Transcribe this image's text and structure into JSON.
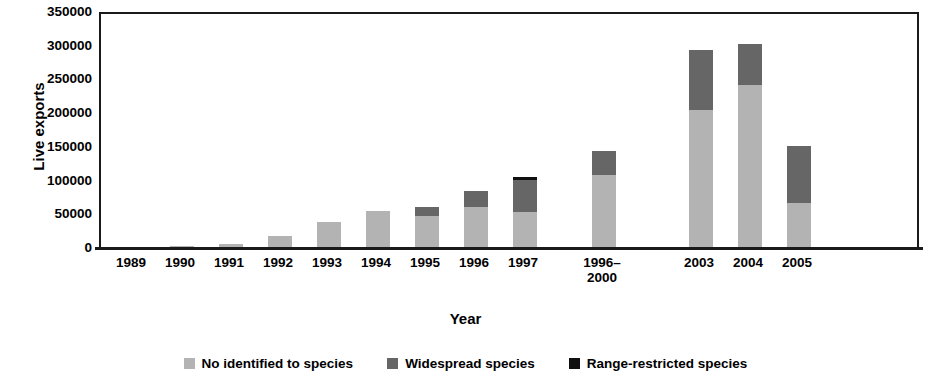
{
  "chart_data": {
    "type": "bar",
    "title": "",
    "subtitle": "",
    "xlabel": "Year",
    "ylabel": "Live exports",
    "ylim": [
      0,
      350000
    ],
    "ytick_values": [
      0,
      50000,
      100000,
      150000,
      200000,
      250000,
      300000,
      350000
    ],
    "ytick_labels": [
      "0",
      "50000",
      "100000",
      "150000",
      "200000",
      "250000",
      "300000",
      "350000"
    ],
    "grid": false,
    "stacked": true,
    "legend_position": "bottom",
    "categories": [
      "1989",
      "1990",
      "1991",
      "1992",
      "1993",
      "1994",
      "1995",
      "1996",
      "1997",
      "1996–2000",
      "2003",
      "2004",
      "2005"
    ],
    "series": [
      {
        "name": "No identified to species",
        "color": "#b3b3b3",
        "values": [
          500,
          3000,
          6000,
          18000,
          38000,
          55000,
          47000,
          61000,
          54000,
          108000,
          204000,
          242000,
          67000
        ]
      },
      {
        "name": "Widespread species",
        "color": "#666666",
        "values": [
          0,
          0,
          0,
          0,
          0,
          0,
          14000,
          23000,
          47000,
          36000,
          89000,
          60000,
          85000
        ]
      },
      {
        "name": "Range-restricted species",
        "color": "#101010",
        "values": [
          0,
          0,
          0,
          0,
          0,
          0,
          0,
          0,
          4000,
          0,
          0,
          0,
          0
        ]
      }
    ],
    "totals": [
      500,
      3000,
      6000,
      18000,
      38000,
      55000,
      61000,
      84000,
      105000,
      144000,
      293000,
      302000,
      152000
    ]
  },
  "legend": {
    "items": [
      {
        "label": "No identified to species",
        "color": "#b3b3b3"
      },
      {
        "label": "Widespread species",
        "color": "#666666"
      },
      {
        "label": "Range-restricted species",
        "color": "#101010"
      }
    ]
  },
  "axes": {
    "y_title": "Live exports",
    "x_title": "Year"
  }
}
